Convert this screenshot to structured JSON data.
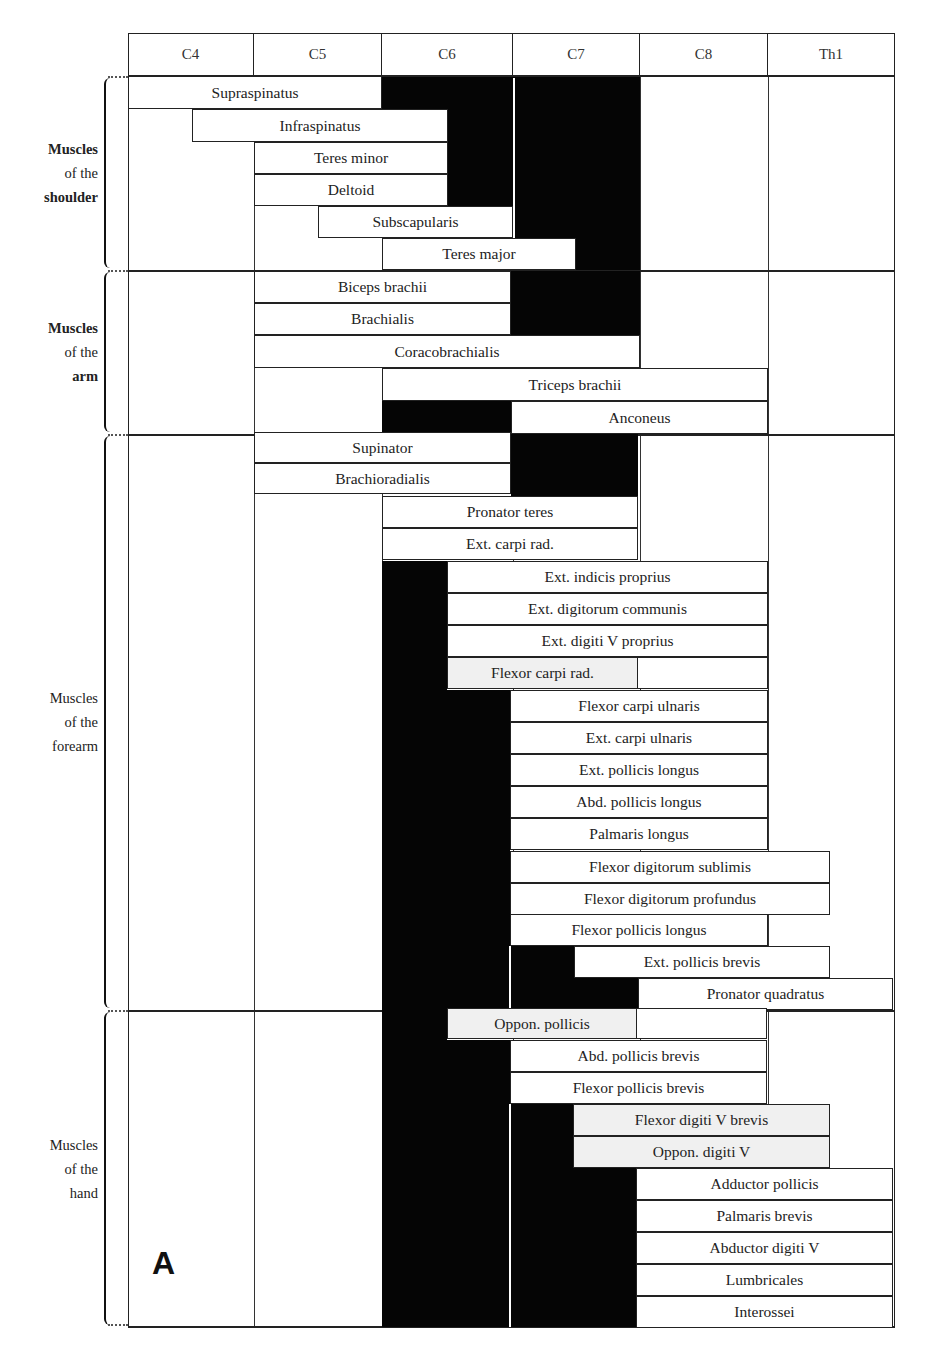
{
  "chart_data": {
    "type": "table",
    "panel_label": "A",
    "columns": [
      "C4",
      "C5",
      "C6",
      "C7",
      "C8",
      "Th1"
    ],
    "legend": {
      "white_box": "minor/partial root contribution",
      "black": "main root contribution"
    },
    "groups": [
      {
        "label_lines": [
          "Muscles",
          "of the",
          "shoulder"
        ],
        "muscles": [
          {
            "name": "Supraspinatus",
            "roots": [
              "C4",
              "C5",
              "C6",
              "C7"
            ],
            "main": [
              "C6",
              "C7"
            ]
          },
          {
            "name": "Infraspinatus",
            "roots": [
              "C4",
              "C5",
              "C6",
              "C7"
            ],
            "main": [
              "C6",
              "C7"
            ]
          },
          {
            "name": "Teres minor",
            "roots": [
              "C5",
              "C6",
              "C7"
            ],
            "main": [
              "C6",
              "C7"
            ]
          },
          {
            "name": "Deltoid",
            "roots": [
              "C5",
              "C6",
              "C7"
            ],
            "main": [
              "C6",
              "C7"
            ]
          },
          {
            "name": "Subscapularis",
            "roots": [
              "C5",
              "C6",
              "C7"
            ],
            "main": [
              "C7"
            ]
          },
          {
            "name": "Teres major",
            "roots": [
              "C6",
              "C7"
            ],
            "main": [
              "C7"
            ]
          }
        ]
      },
      {
        "label_lines": [
          "Muscles",
          "of the",
          "arm"
        ],
        "muscles": [
          {
            "name": "Biceps brachii",
            "roots": [
              "C5",
              "C6",
              "C7"
            ],
            "main": [
              "C7"
            ]
          },
          {
            "name": "Brachialis",
            "roots": [
              "C5",
              "C6",
              "C7"
            ],
            "main": [
              "C7"
            ]
          },
          {
            "name": "Coracobrachialis",
            "roots": [
              "C5",
              "C6",
              "C7"
            ],
            "main": []
          },
          {
            "name": "Triceps brachii",
            "roots": [
              "C6",
              "C7",
              "C8"
            ],
            "main": []
          },
          {
            "name": "Anconeus",
            "roots": [
              "C6",
              "C7",
              "C8"
            ],
            "main": [
              "C6"
            ]
          }
        ]
      },
      {
        "label_lines": [
          "Muscles",
          "of the",
          "forearm"
        ],
        "muscles": [
          {
            "name": "Supinator",
            "roots": [
              "C5",
              "C6",
              "C7"
            ],
            "main": [
              "C7"
            ]
          },
          {
            "name": "Brachioradialis",
            "roots": [
              "C5",
              "C6",
              "C7"
            ],
            "main": [
              "C7"
            ]
          },
          {
            "name": "Pronator teres",
            "roots": [
              "C6",
              "C7"
            ],
            "main": []
          },
          {
            "name": "Ext. carpi rad.",
            "roots": [
              "C6",
              "C7"
            ],
            "main": []
          },
          {
            "name": "Ext. indicis proprius",
            "roots": [
              "C6",
              "C7",
              "C8"
            ],
            "main": [
              "C6"
            ]
          },
          {
            "name": "Ext. digitorum communis",
            "roots": [
              "C6",
              "C7",
              "C8"
            ],
            "main": [
              "C6"
            ]
          },
          {
            "name": "Ext. digiti V proprius",
            "roots": [
              "C6",
              "C7",
              "C8"
            ],
            "main": [
              "C6"
            ]
          },
          {
            "name": "Flexor carpi rad.",
            "roots": [
              "C6",
              "C7"
            ],
            "main": [
              "C6"
            ]
          },
          {
            "name": "Flexor carpi ulnaris",
            "roots": [
              "C6",
              "C7",
              "C8"
            ],
            "main": [
              "C6"
            ]
          },
          {
            "name": "Ext. carpi ulnaris",
            "roots": [
              "C6",
              "C7",
              "C8"
            ],
            "main": [
              "C6"
            ]
          },
          {
            "name": "Ext. pollicis longus",
            "roots": [
              "C6",
              "C7",
              "C8"
            ],
            "main": [
              "C6"
            ]
          },
          {
            "name": "Abd. pollicis longus",
            "roots": [
              "C6",
              "C7",
              "C8"
            ],
            "main": [
              "C6"
            ]
          },
          {
            "name": "Palmaris longus",
            "roots": [
              "C6",
              "C7",
              "C8"
            ],
            "main": [
              "C6"
            ]
          },
          {
            "name": "Flexor digitorum sublimis",
            "roots": [
              "C6",
              "C7",
              "C8",
              "Th1"
            ],
            "main": [
              "C6"
            ]
          },
          {
            "name": "Flexor digitorum profundus",
            "roots": [
              "C6",
              "C7",
              "C8",
              "Th1"
            ],
            "main": [
              "C6"
            ]
          },
          {
            "name": "Flexor pollicis longus",
            "roots": [
              "C6",
              "C7",
              "C8"
            ],
            "main": [
              "C6"
            ]
          },
          {
            "name": "Ext. pollicis brevis",
            "roots": [
              "C6",
              "C7",
              "C8",
              "Th1"
            ],
            "main": [
              "C6",
              "C7"
            ]
          },
          {
            "name": "Pronator quadratus",
            "roots": [
              "C6",
              "C7",
              "C8",
              "Th1"
            ],
            "main": [
              "C6",
              "C7"
            ]
          }
        ]
      },
      {
        "label_lines": [
          "Muscles",
          "of the",
          "hand"
        ],
        "muscles": [
          {
            "name": "Oppon. pollicis",
            "roots": [
              "C6",
              "C7",
              "C8"
            ],
            "main": [
              "C6"
            ]
          },
          {
            "name": "Abd. pollicis brevis",
            "roots": [
              "C6",
              "C7",
              "C8"
            ],
            "main": [
              "C6"
            ]
          },
          {
            "name": "Flexor pollicis brevis",
            "roots": [
              "C6",
              "C7",
              "C8"
            ],
            "main": [
              "C6"
            ]
          },
          {
            "name": "Flexor digiti V brevis",
            "roots": [
              "C6",
              "C7",
              "C8",
              "Th1"
            ],
            "main": [
              "C6",
              "C7"
            ]
          },
          {
            "name": "Oppon. digiti V",
            "roots": [
              "C6",
              "C7",
              "C8",
              "Th1"
            ],
            "main": [
              "C6",
              "C7"
            ]
          },
          {
            "name": "Adductor pollicis",
            "roots": [
              "C6",
              "C7",
              "C8",
              "Th1"
            ],
            "main": [
              "C6",
              "C7"
            ]
          },
          {
            "name": "Palmaris brevis",
            "roots": [
              "C6",
              "C7",
              "C8",
              "Th1"
            ],
            "main": [
              "C6",
              "C7"
            ]
          },
          {
            "name": "Abductor digiti V",
            "roots": [
              "C6",
              "C7",
              "C8",
              "Th1"
            ],
            "main": [
              "C6",
              "C7"
            ]
          },
          {
            "name": "Lumbricales",
            "roots": [
              "C6",
              "C7",
              "C8",
              "Th1"
            ],
            "main": [
              "C6",
              "C7"
            ]
          },
          {
            "name": "Interossei",
            "roots": [
              "C6",
              "C7",
              "C8",
              "Th1"
            ],
            "main": [
              "C6",
              "C7"
            ]
          }
        ]
      }
    ]
  },
  "layout": {
    "col_x": [
      128,
      254,
      382,
      513,
      640,
      768,
      895
    ],
    "group_bounds": [
      [
        76,
        270
      ],
      [
        270,
        434
      ],
      [
        434,
        1010
      ],
      [
        1010,
        1327
      ]
    ],
    "boxes": [
      {
        "label": "Supraspinatus",
        "x1": 128,
        "x2": 382,
        "y": 76,
        "h": 33
      },
      {
        "label": "Infraspinatus",
        "x1": 192,
        "x2": 448,
        "y": 109,
        "h": 33
      },
      {
        "label": "Teres minor",
        "x1": 254,
        "x2": 448,
        "y": 142,
        "h": 32
      },
      {
        "label": "Deltoid",
        "x1": 254,
        "x2": 448,
        "y": 174,
        "h": 32
      },
      {
        "label": "Subscapularis",
        "x1": 318,
        "x2": 513,
        "y": 206,
        "h": 32
      },
      {
        "label": "Teres major",
        "x1": 382,
        "x2": 576,
        "y": 238,
        "h": 32
      },
      {
        "label": "Biceps brachii",
        "x1": 254,
        "x2": 511,
        "y": 271,
        "h": 32
      },
      {
        "label": "Brachialis",
        "x1": 254,
        "x2": 511,
        "y": 303,
        "h": 32
      },
      {
        "label": "Coracobrachialis",
        "x1": 254,
        "x2": 640,
        "y": 335,
        "h": 33
      },
      {
        "label": "Triceps brachii",
        "x1": 382,
        "x2": 768,
        "y": 368,
        "h": 33
      },
      {
        "label": "Anconeus",
        "x1": 511,
        "x2": 768,
        "y": 401,
        "h": 33
      },
      {
        "label": "Supinator",
        "x1": 254,
        "x2": 511,
        "y": 432,
        "h": 31
      },
      {
        "label": "Brachioradialis",
        "x1": 254,
        "x2": 511,
        "y": 463,
        "h": 31
      },
      {
        "label": "Pronator teres",
        "x1": 382,
        "x2": 638,
        "y": 496,
        "h": 32
      },
      {
        "label": "Ext. carpi rad.",
        "x1": 382,
        "x2": 638,
        "y": 528,
        "h": 32
      },
      {
        "label": "Ext. indicis proprius",
        "x1": 447,
        "x2": 768,
        "y": 561,
        "h": 32
      },
      {
        "label": "Ext. digitorum communis",
        "x1": 447,
        "x2": 768,
        "y": 593,
        "h": 32
      },
      {
        "label": "Ext. digiti V proprius",
        "x1": 447,
        "x2": 768,
        "y": 625,
        "h": 32
      },
      {
        "label": "Flexor carpi rad.",
        "x1": 447,
        "x2": 638,
        "y": 657,
        "h": 32,
        "shade": true,
        "ext": 768
      },
      {
        "label": "Flexor carpi ulnaris",
        "x1": 510,
        "x2": 768,
        "y": 690,
        "h": 32
      },
      {
        "label": "Ext. carpi ulnaris",
        "x1": 510,
        "x2": 768,
        "y": 722,
        "h": 32
      },
      {
        "label": "Ext. pollicis longus",
        "x1": 510,
        "x2": 768,
        "y": 754,
        "h": 32
      },
      {
        "label": "Abd. pollicis longus",
        "x1": 510,
        "x2": 768,
        "y": 786,
        "h": 32
      },
      {
        "label": "Palmaris longus",
        "x1": 510,
        "x2": 768,
        "y": 818,
        "h": 32
      },
      {
        "label": "Flexor digitorum sublimis",
        "x1": 510,
        "x2": 830,
        "y": 851,
        "h": 32
      },
      {
        "label": "Flexor digitorum profundus",
        "x1": 510,
        "x2": 830,
        "y": 883,
        "h": 32
      },
      {
        "label": "Flexor pollicis longus",
        "x1": 510,
        "x2": 768,
        "y": 914,
        "h": 32
      },
      {
        "label": "Ext. pollicis brevis",
        "x1": 574,
        "x2": 830,
        "y": 946,
        "h": 32
      },
      {
        "label": "Pronator quadratus",
        "x1": 638,
        "x2": 893,
        "y": 978,
        "h": 32
      },
      {
        "label": "Oppon. pollicis",
        "x1": 447,
        "x2": 637,
        "y": 1008,
        "h": 31,
        "shade": true,
        "ext": 767
      },
      {
        "label": "Abd. pollicis brevis",
        "x1": 510,
        "x2": 767,
        "y": 1040,
        "h": 32
      },
      {
        "label": "Flexor pollicis brevis",
        "x1": 510,
        "x2": 767,
        "y": 1072,
        "h": 32
      },
      {
        "label": "Flexor digiti V brevis",
        "x1": 573,
        "x2": 830,
        "y": 1104,
        "h": 32,
        "shade": true
      },
      {
        "label": "Oppon. digiti V",
        "x1": 573,
        "x2": 830,
        "y": 1136,
        "h": 32,
        "shade": true
      },
      {
        "label": "Adductor pollicis",
        "x1": 636,
        "x2": 893,
        "y": 1168,
        "h": 32
      },
      {
        "label": "Palmaris brevis",
        "x1": 636,
        "x2": 893,
        "y": 1200,
        "h": 32
      },
      {
        "label": "Abductor digiti V",
        "x1": 636,
        "x2": 893,
        "y": 1232,
        "h": 32
      },
      {
        "label": "Lumbricales",
        "x1": 636,
        "x2": 893,
        "y": 1264,
        "h": 32
      },
      {
        "label": "Interossei",
        "x1": 636,
        "x2": 893,
        "y": 1296,
        "h": 32
      }
    ],
    "blacks": [
      {
        "x1": 382,
        "x2": 511,
        "y1": 77,
        "y2": 206
      },
      {
        "x1": 515,
        "x2": 640,
        "y1": 77,
        "y2": 270
      },
      {
        "x1": 511,
        "x2": 515,
        "y1": 77,
        "y2": 270
      },
      {
        "x1": 513,
        "x2": 576,
        "y1": 206,
        "y2": 238
      },
      {
        "x1": 576,
        "x2": 640,
        "y1": 238,
        "y2": 270
      },
      {
        "x1": 511,
        "x2": 640,
        "y1": 271,
        "y2": 335
      },
      {
        "x1": 382,
        "x2": 511,
        "y1": 401,
        "y2": 432
      },
      {
        "x1": 511,
        "x2": 638,
        "y1": 432,
        "y2": 496
      },
      {
        "x1": 382,
        "x2": 447,
        "y1": 561,
        "y2": 690
      },
      {
        "x1": 382,
        "x2": 510,
        "y1": 690,
        "y2": 1010
      },
      {
        "x1": 510,
        "x2": 574,
        "y1": 946,
        "y2": 978
      },
      {
        "x1": 510,
        "x2": 638,
        "y1": 978,
        "y2": 1010
      },
      {
        "x1": 382,
        "x2": 447,
        "y1": 1008,
        "y2": 1040
      },
      {
        "x1": 382,
        "x2": 510,
        "y1": 1040,
        "y2": 1327
      },
      {
        "x1": 510,
        "x2": 573,
        "y1": 1104,
        "y2": 1168
      },
      {
        "x1": 510,
        "x2": 636,
        "y1": 1168,
        "y2": 1327
      }
    ],
    "white_gaps": [
      {
        "x": 513,
        "y1": 78,
        "y2": 270
      },
      {
        "x": 509,
        "y1": 946,
        "y2": 1010
      },
      {
        "x": 509,
        "y1": 1104,
        "y2": 1327
      }
    ]
  }
}
